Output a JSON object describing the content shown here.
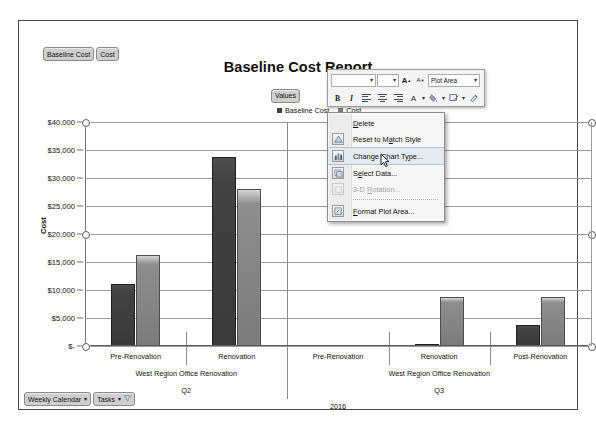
{
  "report": {
    "field_pills": [
      {
        "label": "Baseline Cost",
        "name": "field-pill-baseline-cost"
      },
      {
        "label": "Cost",
        "name": "field-pill-cost"
      }
    ],
    "title": "Baseline Cost Report",
    "values_pill": "Values",
    "bottom_pills": [
      {
        "label": "Weekly Calendar",
        "caret": "▾"
      },
      {
        "label": "Tasks",
        "caret": "▾"
      }
    ]
  },
  "legend": {
    "items": [
      {
        "label": "Baseline Cost",
        "color": "#404040"
      },
      {
        "label": "Cost",
        "color": "#808080"
      }
    ],
    "position": "top"
  },
  "mini_toolbar": {
    "font_name": "",
    "font_size": "",
    "grow_font": "A",
    "shrink_font": "A",
    "element_selector": "Plot Area",
    "bold": "B",
    "italic": "I",
    "align_left": "align-left",
    "align_center": "align-center",
    "align_right": "align-right",
    "font_color": "A",
    "fill_color": "fill-bucket",
    "shape_outline": "shape-outline",
    "format_painter": "format-painter",
    "caret": "▾"
  },
  "context_menu": {
    "items": [
      {
        "label": "Delete",
        "accel": "D",
        "icon": "none",
        "state": "normal"
      },
      {
        "label": "Reset to Match Style",
        "accel": "a",
        "icon": "reset-style-icon",
        "state": "normal"
      },
      {
        "label": "Change Chart Type...",
        "accel": "y",
        "icon": "chart-type-icon",
        "state": "highlighted"
      },
      {
        "label": "Select Data...",
        "accel": "e",
        "icon": "select-data-icon",
        "state": "normal"
      },
      {
        "label": "3-D Rotation...",
        "accel": "R",
        "icon": "rotation-icon",
        "state": "disabled"
      },
      {
        "label": "Format Plot Area...",
        "accel": "F",
        "icon": "format-icon",
        "state": "normal"
      }
    ]
  },
  "chart_data": {
    "type": "bar",
    "title": "Baseline Cost Report",
    "xlabel": "",
    "ylabel": "Cost",
    "ylim": [
      0,
      40000
    ],
    "ytick_labels": [
      "$40,000",
      "$35,000",
      "$30,000",
      "$25,000",
      "$20,000",
      "$15,000",
      "$10,000",
      "$5,000",
      "$-"
    ],
    "ytick_values": [
      40000,
      35000,
      30000,
      25000,
      20000,
      15000,
      10000,
      5000,
      0
    ],
    "grid": true,
    "legend_position": "top",
    "categories": [
      "Pre-Renovation",
      "Renovation",
      "Pre-Renovation",
      "Renovation",
      "Post-Renovation"
    ],
    "group_levels": [
      {
        "label": "West Region Office Renovation",
        "span": [
          0,
          1
        ]
      },
      {
        "label": "West Region Office Renovation",
        "span": [
          2,
          4
        ]
      }
    ],
    "quarter_levels": [
      {
        "label": "Q2",
        "span": [
          0,
          1
        ]
      },
      {
        "label": "Q3",
        "span": [
          2,
          4
        ]
      }
    ],
    "year_levels": [
      {
        "label": "2016",
        "span": [
          0,
          4
        ]
      }
    ],
    "series": [
      {
        "name": "Baseline Cost",
        "color": "#404040",
        "values": [
          11000,
          33700,
          0,
          200,
          3700
        ]
      },
      {
        "name": "Cost",
        "color": "#808080",
        "values": [
          16200,
          28000,
          0,
          8800,
          8800
        ]
      }
    ]
  }
}
